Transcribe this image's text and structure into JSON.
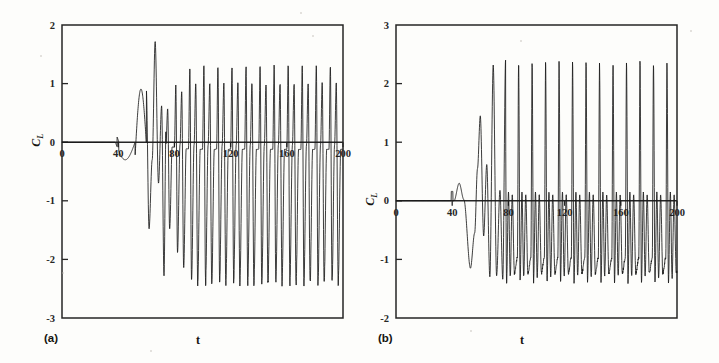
{
  "figure": {
    "panels": [
      {
        "tag": "(a)",
        "xlabel": "t",
        "ylabel": "CL",
        "ylabel_base": "C",
        "ylabel_sub": "L"
      },
      {
        "tag": "(b)",
        "xlabel": "t",
        "ylabel": "CL",
        "ylabel_base": "C",
        "ylabel_sub": "L"
      }
    ]
  },
  "chart_data": [
    {
      "type": "line",
      "panel": "(a)",
      "title": "",
      "xlabel": "t",
      "ylabel": "CL",
      "xlim": [
        0,
        200
      ],
      "ylim": [
        -3,
        2
      ],
      "xticks": [
        0,
        40,
        80,
        120,
        160,
        200
      ],
      "yticks": [
        2,
        1,
        0,
        -1,
        -2,
        -3
      ],
      "grid": false,
      "legend": null,
      "line_color": "#1a1a1a",
      "description": "Lift coefficient time history: flat near zero until t~38, small negative dip, growth of oscillation from t~50, settling into a periodic limit cycle with a repeating two-peak pattern per cycle.",
      "waveform": {
        "quiet_until": 38,
        "onset": 50,
        "saturated_by": 96,
        "period": 10.0,
        "steady_primary_peak": 1.3,
        "steady_primary_trough": -2.4,
        "steady_secondary_peak": 1.0,
        "steady_secondary_trough": -0.12,
        "transient_marker_t": 40,
        "transient_dip_min": -0.3,
        "transient_first_peak": 1.05,
        "transient_first_peak_t": 55,
        "transient_max_peak": 1.72,
        "transient_max_peak_t": 68
      },
      "annotations": [
        {
          "t": 40,
          "label": "tick marker on axis"
        }
      ]
    },
    {
      "type": "line",
      "panel": "(b)",
      "title": "",
      "xlabel": "t",
      "ylabel": "CL",
      "xlim": [
        0,
        200
      ],
      "ylim": [
        -2,
        3
      ],
      "xticks": [
        0,
        40,
        80,
        120,
        160,
        200
      ],
      "yticks": [
        3,
        2,
        1,
        0,
        -1,
        -2
      ],
      "grid": false,
      "legend": null,
      "line_color": "#1a1a1a",
      "description": "Lift coefficient time history: flat near zero until t~38, a small positive hump near t=45, a deep dip to about -1.15 near t=52, then rapidly growing oscillations reaching a limit cycle of tall narrow spikes near 2.35 alternating with small peaks near 0.15 and troughs near -1.3.",
      "waveform": {
        "quiet_until": 38,
        "onset": 48,
        "saturated_by": 78,
        "period": 9.6,
        "steady_primary_peak": 2.35,
        "steady_primary_trough": -1.3,
        "steady_secondary_peak": 0.15,
        "steady_secondary_trough": -1.38,
        "transient_marker_t": 40,
        "transient_hump_peak": 0.3,
        "transient_hump_t": 45,
        "transient_deep_dip": -1.15,
        "transient_deep_dip_t": 53,
        "transient_first_spike": 1.45,
        "transient_first_spike_t": 60
      },
      "annotations": [
        {
          "t": 40,
          "label": "tick marker on axis"
        }
      ]
    }
  ]
}
